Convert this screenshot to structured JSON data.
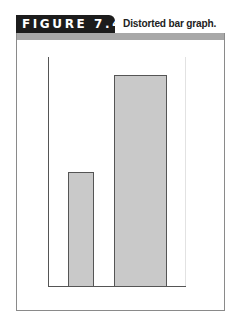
{
  "figure": {
    "label": "FIGURE 7.4",
    "caption": "Distorted bar graph.",
    "colors": {
      "tab": "#1c1c1c",
      "band": "#a8a8a8",
      "bar_fill": "#c9c9c9",
      "bar_stroke": "#555555"
    }
  },
  "chart_data": {
    "type": "bar",
    "title": "Distorted bar graph.",
    "categories": [
      "",
      ""
    ],
    "values": [
      115,
      212
    ],
    "xlabel": "",
    "ylabel": "",
    "ylim": [
      0,
      230
    ],
    "grid": false,
    "legend": null,
    "annotations": []
  }
}
